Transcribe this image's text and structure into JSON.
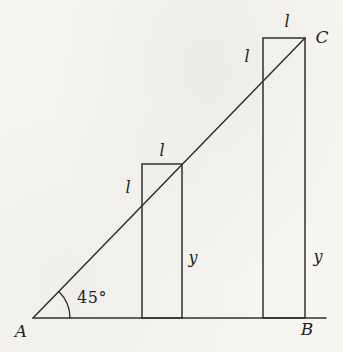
{
  "figure": {
    "vertices": {
      "a": "A",
      "b": "B",
      "c": "C"
    },
    "angle_label": "45°",
    "small_rectangle": {
      "top_label": "l",
      "side_label": "l",
      "height_label": "y"
    },
    "large_rectangle": {
      "top_label": "l",
      "side_label": "l",
      "height_label": "y"
    },
    "colors": {
      "line": "#32302c",
      "label": "#211f1c",
      "background": "#f6f5f1"
    }
  }
}
